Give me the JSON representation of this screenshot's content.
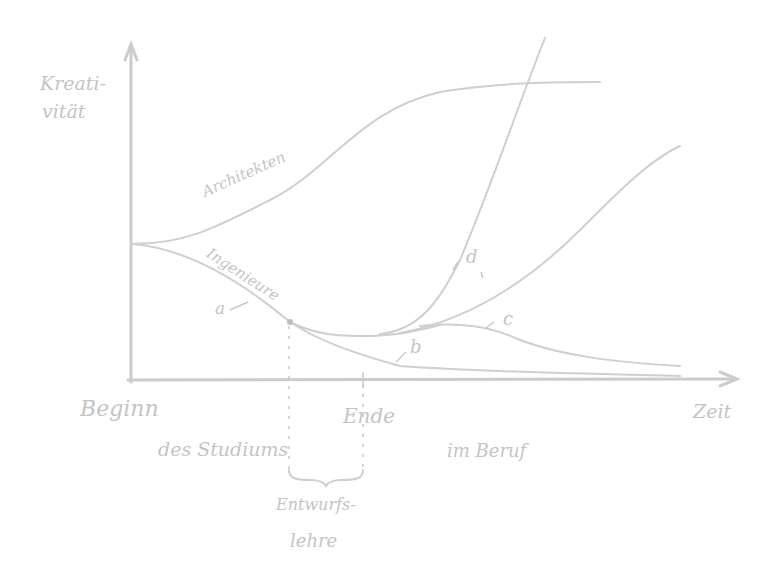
{
  "diagram": {
    "type": "hand-drawn line sketch",
    "stroke_color": "#cfcfcf",
    "text_color": "#c4c4c4",
    "background": "#ffffff",
    "y_axis_label_line1": "Kreati-",
    "y_axis_label_line2": "vität",
    "x_axis_label": "Zeit",
    "curves": {
      "architects": {
        "label": "Architekten"
      },
      "engineers": {
        "label": "Ingenieure"
      },
      "a": {
        "label": "a"
      },
      "b": {
        "label": "b"
      },
      "c": {
        "label": "c"
      },
      "d": {
        "label": "d"
      }
    },
    "x_annotations": {
      "start": "Beginn",
      "study": "des Studiums",
      "end": "Ende",
      "career": "im Beruf",
      "design_teaching_line1": "Entwurfs-",
      "design_teaching_line2": "lehre"
    }
  }
}
